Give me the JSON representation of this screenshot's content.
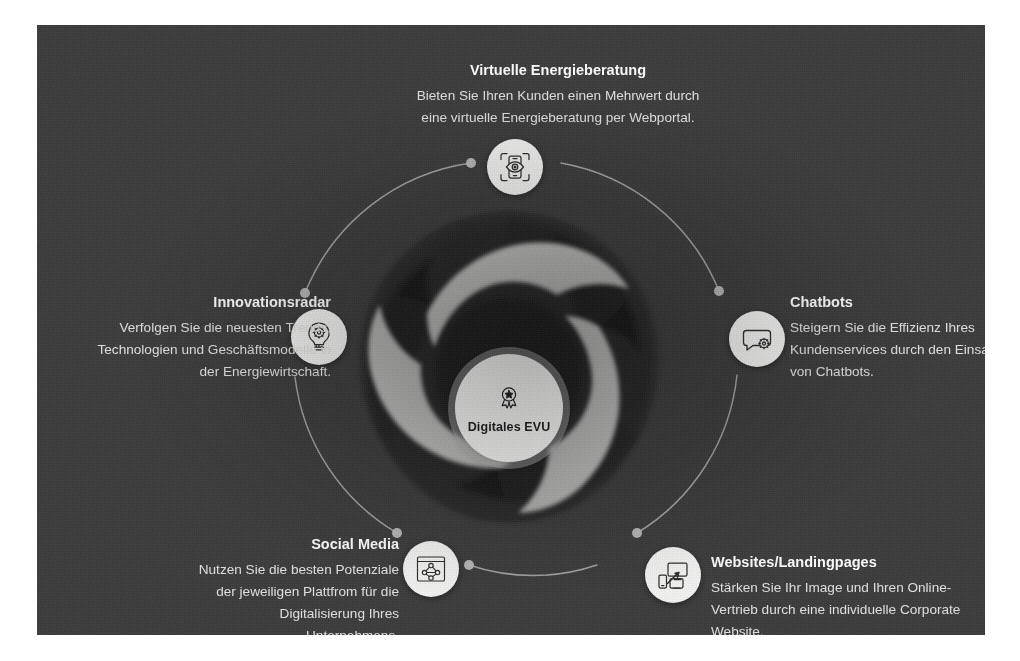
{
  "diagram": {
    "center": {
      "label": "Digitales EVU",
      "icon": "award-badge-icon"
    },
    "nodes": [
      {
        "id": "virtuelle-energieberatung",
        "title": "Virtuelle Energieberatung",
        "description": "Bieten Sie Ihren Kunden einen Mehrwert durch eine virtuelle Energieberatung per Webportal.",
        "icon": "smartphone-eye-scan-icon",
        "align": "center"
      },
      {
        "id": "chatbots",
        "title": "Chatbots",
        "description": "Steigern Sie die Effizienz Ihres Kundenservices durch den Einsatz von Chatbots.",
        "icon": "speech-bubble-gear-icon",
        "align": "left"
      },
      {
        "id": "websites-landingpages",
        "title": "Websites/Landingpages",
        "description": "Stärken Sie Ihr Image und Ihren Online-Vertrieb durch eine individuelle Corporate Website.",
        "icon": "responsive-devices-cursor-icon",
        "align": "left"
      },
      {
        "id": "social-media",
        "title": "Social Media",
        "description": "Nutzen Sie die besten Potenziale der jeweiligen Plattfrom für die Digitalisierung Ihres Unternehmens.",
        "icon": "network-share-frame-icon",
        "align": "right"
      },
      {
        "id": "innovationsradar",
        "title": "Innovationsradar",
        "description": "Verfolgen Sie die neuesten Trends, Technologien und Geschäftsmodelle in der Energiewirtschaft.",
        "icon": "lightbulb-gear-icon",
        "align": "right"
      }
    ],
    "colors": {
      "background": "#3b3b3b",
      "card_backdrop": "#2a2a2a",
      "blade_light": "#b9b9b7",
      "blade_dark": "#232323",
      "node_bubble": "#f4f4f2",
      "hub_circle": "#fbfbf9",
      "connector_line": "#b5b5b3",
      "title_text": "#ffffff",
      "body_text": "#e2e2e0"
    }
  }
}
